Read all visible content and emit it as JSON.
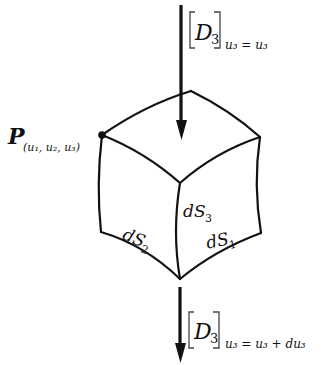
{
  "diagram": {
    "type": "curvilinear volume element",
    "point_label": {
      "main": "P",
      "sub": "(u₁, u₂, u₃)"
    },
    "top_flux": {
      "main": "D",
      "main_sub": "3",
      "condition": "u₃ = u₃"
    },
    "bottom_flux": {
      "main": "D",
      "main_sub": "3",
      "condition": "u₃ = u₃ + du₃"
    },
    "faces": [
      {
        "label": "dS",
        "sub": "3"
      },
      {
        "label": "dS",
        "sub": "2"
      },
      {
        "label": "dS",
        "sub": "1"
      }
    ],
    "colors": {
      "line": "#111111",
      "background": "#ffffff"
    }
  }
}
